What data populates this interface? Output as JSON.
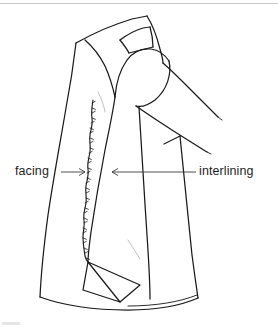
{
  "figure": {
    "background_color": "#ffffff",
    "ink_color": "#1a1a1a",
    "width": 278,
    "height": 331
  },
  "annotations": [
    {
      "id": "facing",
      "label": "facing",
      "arrow_direction": "right",
      "text_x": 15,
      "text_y": 165,
      "leader_from_x": 61,
      "leader_to_x": 85,
      "leader_y": 172
    },
    {
      "id": "interlining",
      "label": "interlining",
      "arrow_direction": "left",
      "text_x": 199,
      "text_y": 165,
      "leader_from_x": 196,
      "leader_to_x": 112,
      "leader_y": 172
    }
  ],
  "drawing_parts": [
    {
      "name": "coat-body-front-outline"
    },
    {
      "name": "coat-collar"
    },
    {
      "name": "coat-shoulder-seam"
    },
    {
      "name": "coat-sleeve"
    },
    {
      "name": "coat-side-seam"
    },
    {
      "name": "coat-hem-curve"
    },
    {
      "name": "coat-hem-double-line"
    },
    {
      "name": "facing-raw-edge"
    },
    {
      "name": "hem-corner-flap"
    }
  ],
  "scan_artifacts": {
    "top_rule": true,
    "bottom_left_smudge": true
  }
}
